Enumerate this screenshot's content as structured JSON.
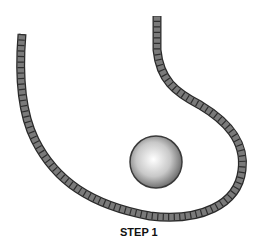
{
  "diagram": {
    "label": "STEP 1",
    "elements": [
      "rope",
      "ball"
    ],
    "colors": {
      "rope": "#6e6e6e",
      "rope_outline": "#2a2a2a",
      "ball_light": "#ffffff",
      "ball_dark": "#6a6a6a"
    }
  }
}
